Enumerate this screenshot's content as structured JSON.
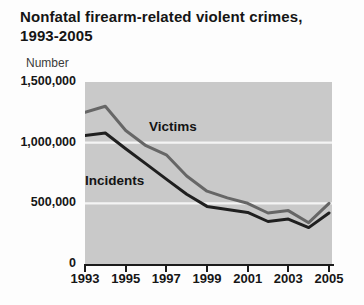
{
  "header": {
    "title_line1": "Nonfatal firearm-related violent crimes,",
    "title_line2": "1993-2005",
    "y_axis_unit_label": "Number"
  },
  "colors": {
    "plot_background": "#c9c9c9",
    "gridline": "#f4f4f4",
    "axis": "#1c1c1c",
    "text": "#161616",
    "victims_line": "#666666",
    "incidents_line": "#1f1f1f"
  },
  "chart_data": {
    "type": "line",
    "title": "Nonfatal firearm-related violent crimes, 1993-2005",
    "xlabel": "",
    "ylabel": "Number",
    "xlim": [
      1993,
      2005
    ],
    "ylim": [
      0,
      1500000
    ],
    "grid": "horizontal white lines on gray panel",
    "legend_position": "inline labels on lines",
    "x": [
      1993,
      1994,
      1995,
      1996,
      1997,
      1998,
      1999,
      2000,
      2001,
      2002,
      2003,
      2004,
      2005
    ],
    "series": [
      {
        "name": "Victims",
        "color": "#666666",
        "values": [
          1250000,
          1300000,
          1100000,
          975000,
          900000,
          725000,
          600000,
          545000,
          500000,
          420000,
          440000,
          340000,
          500000
        ]
      },
      {
        "name": "Incidents",
        "color": "#1f1f1f",
        "values": [
          1060000,
          1080000,
          950000,
          825000,
          700000,
          575000,
          475000,
          450000,
          425000,
          350000,
          370000,
          300000,
          420000
        ]
      }
    ],
    "gridlines": [
      1000000,
      500000
    ],
    "y_ticks": [
      1500000,
      1000000,
      500000,
      0
    ],
    "y_tick_labels": [
      "1,500,000",
      "1,000,000",
      "500,000",
      "0"
    ],
    "x_ticks": [
      1993,
      1995,
      1997,
      1999,
      2001,
      2003,
      2005
    ],
    "x_tick_labels": [
      "1993",
      "1995",
      "1997",
      "1999",
      "2001",
      "2003",
      "2005"
    ]
  }
}
